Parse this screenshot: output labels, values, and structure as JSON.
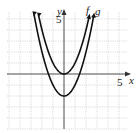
{
  "chart_data": {
    "type": "line",
    "title": "",
    "xlabel": "x",
    "ylabel": "y",
    "xlim": [
      -5,
      5.5
    ],
    "ylim": [
      -5,
      5.5
    ],
    "grid": true,
    "tick_labels": {
      "x": "5",
      "y": "5"
    },
    "series": [
      {
        "name": "f",
        "equation": "y = x^2",
        "vertex": [
          0,
          0
        ],
        "x": [
          -2.3,
          -2,
          -1,
          0,
          1,
          2,
          2.3
        ],
        "y": [
          5.29,
          4,
          1,
          0,
          1,
          4,
          5.29
        ]
      },
      {
        "name": "g",
        "equation": "y = x^2 - 2",
        "vertex": [
          0,
          -2
        ],
        "x": [
          -2.7,
          -2,
          -1,
          0,
          1,
          2,
          2.7
        ],
        "y": [
          5.29,
          2,
          -1,
          -2,
          -1,
          2,
          5.29
        ]
      }
    ],
    "legend": [
      "f",
      "g"
    ]
  },
  "labels": {
    "x_axis": "x",
    "y_axis": "y",
    "x_tick": "5",
    "y_tick": "5",
    "f": "f",
    "g": "g"
  }
}
